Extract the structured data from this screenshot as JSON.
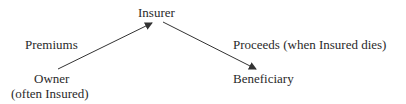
{
  "diagram": {
    "nodes": {
      "insurer": "Insurer",
      "owner": "Owner",
      "owner_note": "(often Insured)",
      "beneficiary": "Beneficiary"
    },
    "edges": {
      "premiums": "Premiums",
      "proceeds": "Proceeds (when Insured dies)"
    },
    "colors": {
      "line": "#333333",
      "text": "#2a2a2a"
    }
  }
}
